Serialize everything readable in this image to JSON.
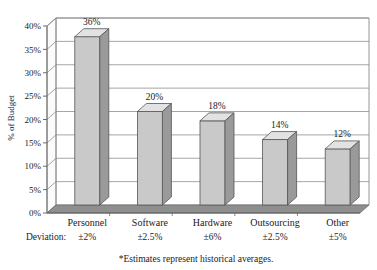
{
  "chart_data": {
    "type": "bar",
    "title": "",
    "subtitle": "",
    "xlabel": "",
    "ylabel": "% of Budget",
    "categories": [
      "Personnel",
      "Software",
      "Hardware",
      "Outsourcing",
      "Other"
    ],
    "values": [
      36,
      20,
      18,
      14,
      12
    ],
    "value_labels": [
      "36%",
      "20%",
      "18%",
      "14%",
      "12%"
    ],
    "deviations": [
      "±2%",
      "±2.5%",
      "±6%",
      "±2.5%",
      "±5%"
    ],
    "deviation_row_label": "Deviation:",
    "ylim": [
      0,
      40
    ],
    "ytick_values": [
      0,
      5,
      10,
      15,
      20,
      25,
      30,
      35,
      40
    ],
    "ytick_labels": [
      "0%",
      "5%",
      "10%",
      "15%",
      "20%",
      "25%",
      "30%",
      "35%",
      "40%"
    ],
    "grid": true,
    "legend": "none",
    "style": "3d-column",
    "footnote": "*Estimates represent historical averages.",
    "colors": {
      "bar_front": "#c9c9c9",
      "bar_top": "#e2e2e2",
      "bar_side": "#9a9a9a",
      "floor": "#8f8f8f",
      "wall": "#f2f2f2",
      "gridline": "#808080",
      "axis": "#6b6b6b",
      "text": "#1a1a1a",
      "background": "#ffffff"
    }
  }
}
